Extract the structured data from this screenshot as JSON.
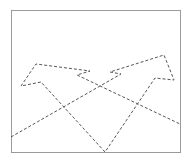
{
  "canvas": {
    "width": 191,
    "height": 163,
    "background": "#ffffff"
  },
  "frame": {
    "x": 11,
    "y": 10,
    "width": 169,
    "height": 142,
    "stroke": "#9a9a9a"
  },
  "path": {
    "stroke": "#555555",
    "dash": "3,2",
    "points": [
      [
        11,
        137
      ],
      [
        121,
        74
      ],
      [
        110,
        72
      ],
      [
        164,
        55
      ],
      [
        174,
        80
      ],
      [
        155,
        78
      ],
      [
        105,
        152
      ],
      [
        41,
        82
      ],
      [
        21,
        86
      ],
      [
        36,
        64
      ],
      [
        90,
        71
      ],
      [
        77,
        75
      ],
      [
        180,
        124
      ]
    ]
  }
}
